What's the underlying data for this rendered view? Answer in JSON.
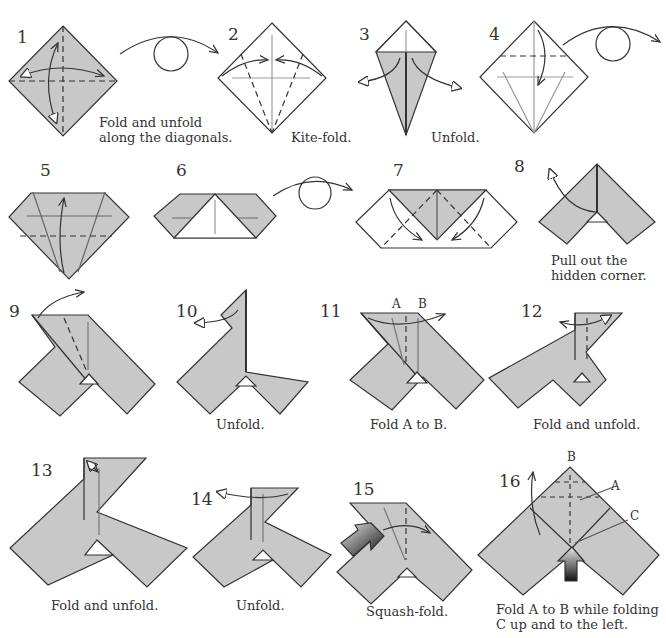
{
  "colors": {
    "paper_shaded": "#c8c8c8",
    "paper_white": "#ffffff",
    "line": "#333333",
    "push_arrow_dark": "#222222"
  },
  "steps": [
    {
      "number": "1",
      "caption": [
        "Fold and unfold",
        "along the diagonals."
      ]
    },
    {
      "number": "2",
      "caption": [
        "Kite-fold."
      ]
    },
    {
      "number": "3",
      "caption": [
        "Unfold."
      ]
    },
    {
      "number": "4",
      "caption": []
    },
    {
      "number": "5",
      "caption": []
    },
    {
      "number": "6",
      "caption": []
    },
    {
      "number": "7",
      "caption": []
    },
    {
      "number": "8",
      "caption": [
        "Pull out the",
        "hidden corner."
      ]
    },
    {
      "number": "9",
      "caption": []
    },
    {
      "number": "10",
      "caption": [
        "Unfold."
      ]
    },
    {
      "number": "11",
      "caption": [
        "Fold A to B."
      ],
      "labels": [
        "A",
        "B"
      ]
    },
    {
      "number": "12",
      "caption": [
        "Fold and unfold."
      ]
    },
    {
      "number": "13",
      "caption": [
        "Fold and unfold."
      ]
    },
    {
      "number": "14",
      "caption": [
        "Unfold."
      ]
    },
    {
      "number": "15",
      "caption": [
        "Squash-fold."
      ]
    },
    {
      "number": "16",
      "caption": [
        "Fold A to B while folding",
        "C up and to the left."
      ],
      "labels": [
        "B",
        "A",
        "C"
      ]
    }
  ]
}
